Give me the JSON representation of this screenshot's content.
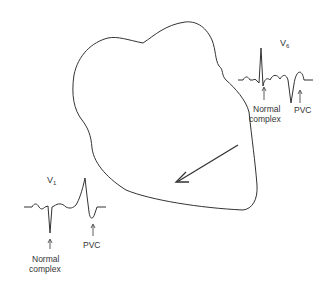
{
  "figure": {
    "lead_v6": {
      "label_main": "V",
      "label_sub": "6",
      "normal_label_line1": "Normal",
      "normal_label_line2": "complex",
      "pvc_label": "PVC"
    },
    "lead_v1": {
      "label_main": "V",
      "label_sub": "1",
      "normal_label_line1": "Normal",
      "normal_label_line2": "complex",
      "pvc_label": "PVC"
    },
    "colors": {
      "stroke": "#333333",
      "background": "#ffffff"
    }
  }
}
